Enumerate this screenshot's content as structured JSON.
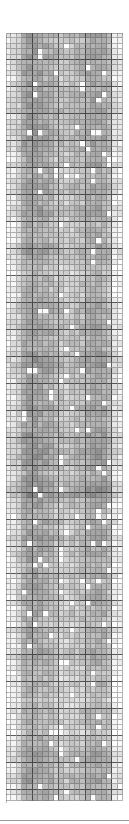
{
  "chart_data": {
    "type": "heatmap",
    "title": "",
    "xlabel": "",
    "ylabel": "",
    "colormap": "grayscale",
    "grid": {
      "columns": 22,
      "rows": 142,
      "cell_width": 5.32,
      "cell_height": 5.42,
      "major_every": 5,
      "grid_lines": true
    },
    "value_range": [
      0,
      1
    ],
    "column_profile": [
      0.12,
      0.18,
      0.3,
      0.55,
      0.62,
      0.6,
      0.58,
      0.55,
      0.5,
      0.42,
      0.38,
      0.36,
      0.4,
      0.42,
      0.46,
      0.52,
      0.55,
      0.58,
      0.55,
      0.45,
      0.15,
      0.1
    ],
    "white_cell_probability": 0.05,
    "noise_amplitude": 0.22,
    "seed": 1729,
    "colors": {
      "background": "#ffffff",
      "min_color": "#ffffff",
      "max_color": "#6e6e6e",
      "separator": "#9a9a9a"
    }
  }
}
